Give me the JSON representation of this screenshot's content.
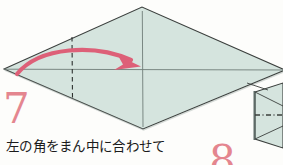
{
  "page": {
    "background_color": "#fdfdfb",
    "width": 283,
    "height": 165
  },
  "step": {
    "number": "7",
    "number_color": "#e4868f",
    "caption": "左の角をまん中に合わせて"
  },
  "next_step": {
    "number": "8",
    "number_color": "#e4868f"
  },
  "diagram": {
    "name": "origami-diamond-fold-step",
    "paper_fill": "#d5e4de",
    "paper_edge": "#3b3f3d",
    "crease_color": "#6f7d78",
    "fold_line_color": "#2d312f",
    "arrow_color": "#dd6078",
    "shape": "diamond",
    "vertices": {
      "left": [
        4,
        69
      ],
      "top": [
        142,
        7
      ],
      "right": [
        285,
        70
      ],
      "bottom": [
        143,
        129
      ]
    },
    "horizontal_crease": {
      "from": [
        4,
        69
      ],
      "to": [
        285,
        70
      ]
    },
    "vertical_crease": {
      "from": [
        142,
        12
      ],
      "to": [
        143,
        126
      ]
    },
    "fold_line": {
      "x": 72,
      "from_y": 37,
      "to_y": 99,
      "style": "dashed"
    },
    "arrow": {
      "label": "fold-left-corner-to-center",
      "from": [
        18,
        74
      ],
      "control": [
        70,
        40
      ],
      "to": [
        140,
        66
      ],
      "head": "right"
    }
  },
  "next_panel": {
    "name": "next-step-partial-diagram",
    "paper_fill": "#d5e4de",
    "paper_edge": "#3b3f3d",
    "dash_dot_line_color": "#3b3f3d",
    "left_edge_x": 253
  }
}
